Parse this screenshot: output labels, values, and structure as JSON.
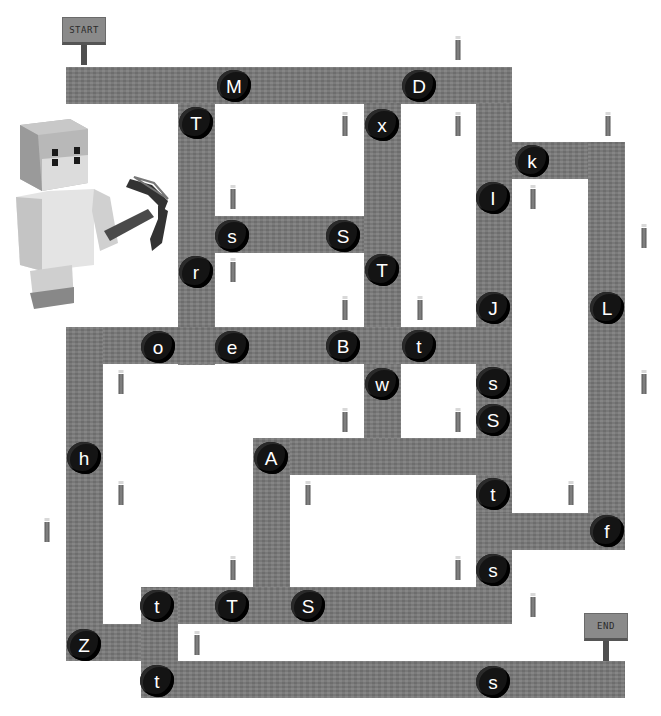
{
  "page": {
    "top_text_cut": "",
    "colors": {
      "background": "#ffffff",
      "path": "#7a7a7a",
      "coal": "#141414",
      "letter": "#ffffff",
      "sign": "#8a8a8a"
    }
  },
  "signs": {
    "start": {
      "label": "START",
      "x": 62,
      "y": 17
    },
    "end": {
      "label": "END",
      "x": 584,
      "y": 613
    }
  },
  "character": {
    "name": "steve-with-pickaxe",
    "x": 12,
    "y": 115
  },
  "paths": [
    {
      "x": 66,
      "y": 67,
      "w": 446,
      "h": 37
    },
    {
      "x": 178,
      "y": 103,
      "w": 37,
      "h": 262
    },
    {
      "x": 364,
      "y": 103,
      "w": 37,
      "h": 372
    },
    {
      "x": 476,
      "y": 103,
      "w": 36,
      "h": 521
    },
    {
      "x": 512,
      "y": 142,
      "w": 113,
      "h": 37
    },
    {
      "x": 588,
      "y": 142,
      "w": 37,
      "h": 408
    },
    {
      "x": 476,
      "y": 513,
      "w": 149,
      "h": 37
    },
    {
      "x": 215,
      "y": 216,
      "w": 149,
      "h": 37
    },
    {
      "x": 66,
      "y": 327,
      "w": 446,
      "h": 37
    },
    {
      "x": 66,
      "y": 327,
      "w": 37,
      "h": 334
    },
    {
      "x": 253,
      "y": 438,
      "w": 259,
      "h": 37
    },
    {
      "x": 253,
      "y": 438,
      "w": 37,
      "h": 186
    },
    {
      "x": 141,
      "y": 587,
      "w": 371,
      "h": 37
    },
    {
      "x": 66,
      "y": 624,
      "w": 112,
      "h": 37
    },
    {
      "x": 141,
      "y": 587,
      "w": 37,
      "h": 111
    },
    {
      "x": 141,
      "y": 661,
      "w": 484,
      "h": 37
    }
  ],
  "coals": [
    {
      "letter": "M",
      "x": 234,
      "y": 86
    },
    {
      "letter": "D",
      "x": 419,
      "y": 86
    },
    {
      "letter": "T",
      "x": 196,
      "y": 123
    },
    {
      "letter": "x",
      "x": 382,
      "y": 125
    },
    {
      "letter": "k",
      "x": 532,
      "y": 161
    },
    {
      "letter": "I",
      "x": 493,
      "y": 198
    },
    {
      "letter": "s",
      "x": 232,
      "y": 236
    },
    {
      "letter": "S",
      "x": 343,
      "y": 236
    },
    {
      "letter": "r",
      "x": 196,
      "y": 272
    },
    {
      "letter": "T",
      "x": 382,
      "y": 270
    },
    {
      "letter": "J",
      "x": 493,
      "y": 308
    },
    {
      "letter": "L",
      "x": 607,
      "y": 308
    },
    {
      "letter": "o",
      "x": 158,
      "y": 347
    },
    {
      "letter": "e",
      "x": 232,
      "y": 347
    },
    {
      "letter": "B",
      "x": 343,
      "y": 346
    },
    {
      "letter": "t",
      "x": 419,
      "y": 346
    },
    {
      "letter": "w",
      "x": 382,
      "y": 384
    },
    {
      "letter": "s",
      "x": 493,
      "y": 383
    },
    {
      "letter": "S",
      "x": 493,
      "y": 420
    },
    {
      "letter": "h",
      "x": 84,
      "y": 458
    },
    {
      "letter": "A",
      "x": 271,
      "y": 458
    },
    {
      "letter": "t",
      "x": 493,
      "y": 494
    },
    {
      "letter": "f",
      "x": 607,
      "y": 531
    },
    {
      "letter": "s",
      "x": 493,
      "y": 570
    },
    {
      "letter": "t",
      "x": 157,
      "y": 606
    },
    {
      "letter": "T",
      "x": 232,
      "y": 606
    },
    {
      "letter": "S",
      "x": 308,
      "y": 606
    },
    {
      "letter": "Z",
      "x": 84,
      "y": 645
    },
    {
      "letter": "t",
      "x": 157,
      "y": 681
    },
    {
      "letter": "s",
      "x": 493,
      "y": 682
    }
  ],
  "torches": [
    {
      "x": 458,
      "y": 48
    },
    {
      "x": 345,
      "y": 124
    },
    {
      "x": 458,
      "y": 124
    },
    {
      "x": 608,
      "y": 124
    },
    {
      "x": 233,
      "y": 197
    },
    {
      "x": 533,
      "y": 197
    },
    {
      "x": 644,
      "y": 236
    },
    {
      "x": 233,
      "y": 270
    },
    {
      "x": 345,
      "y": 308
    },
    {
      "x": 420,
      "y": 308
    },
    {
      "x": 121,
      "y": 382
    },
    {
      "x": 644,
      "y": 382
    },
    {
      "x": 345,
      "y": 420
    },
    {
      "x": 458,
      "y": 420
    },
    {
      "x": 121,
      "y": 493
    },
    {
      "x": 308,
      "y": 493
    },
    {
      "x": 571,
      "y": 493
    },
    {
      "x": 47,
      "y": 530
    },
    {
      "x": 233,
      "y": 568
    },
    {
      "x": 458,
      "y": 568
    },
    {
      "x": 533,
      "y": 605
    },
    {
      "x": 197,
      "y": 643
    }
  ]
}
